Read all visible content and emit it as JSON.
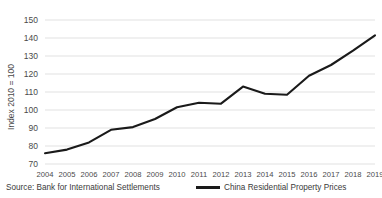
{
  "chart_data": {
    "type": "line",
    "title": "",
    "xlabel": "",
    "ylabel": "Index 2010 = 100",
    "ylim": [
      70,
      150
    ],
    "ytick_step": 10,
    "yticks": [
      "150",
      "140",
      "130",
      "120",
      "110",
      "100",
      "90",
      "80",
      "70"
    ],
    "grid": true,
    "legend_position": "bottom-center",
    "categories": [
      "2004",
      "2005",
      "2006",
      "2007",
      "2008",
      "2009",
      "2010",
      "2011",
      "2012",
      "2013",
      "2014",
      "2015",
      "2016",
      "2017",
      "2018",
      "2019"
    ],
    "series": [
      {
        "name": "China Residential Property Prices",
        "color": "#1a1a1a",
        "values": [
          76,
          78,
          82,
          89,
          90.5,
          95,
          101.5,
          104,
          103.5,
          113,
          109,
          108.5,
          119,
          125,
          133,
          141.5
        ]
      }
    ],
    "annotations": {
      "source": "Source: Bank for International Settlements"
    }
  },
  "legend": {
    "entries": [
      {
        "label": "China Residential Property Prices",
        "color": "#1a1a1a"
      }
    ]
  },
  "footer": {
    "source_text": "Source: Bank for International Settlements"
  },
  "colors": {
    "line": "#1a1a1a",
    "grid": "#d9d9d9",
    "text": "#3a3a3a",
    "background": "#ffffff"
  }
}
